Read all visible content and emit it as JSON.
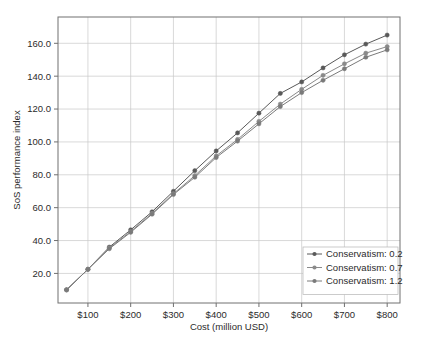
{
  "chart_data": {
    "type": "line",
    "title": "",
    "xlabel": "Cost (million USD)",
    "ylabel": "SoS performance index",
    "xlim": [
      30,
      830
    ],
    "ylim": [
      2,
      176
    ],
    "grid": true,
    "legend_position": "lower right",
    "xtick_labels": [
      "$100",
      "$200",
      "$300",
      "$400",
      "$500",
      "$600",
      "$700",
      "$800"
    ],
    "xtick_values": [
      100,
      200,
      300,
      400,
      500,
      600,
      700,
      800
    ],
    "ytick_labels": [
      "20.0",
      "40.0",
      "60.0",
      "80.0",
      "100.0",
      "120.0",
      "140.0",
      "160.0"
    ],
    "ytick_values": [
      20,
      40,
      60,
      80,
      100,
      120,
      140,
      160
    ],
    "x": [
      50,
      100,
      150,
      200,
      250,
      300,
      350,
      400,
      450,
      500,
      550,
      600,
      650,
      700,
      750,
      800
    ],
    "series": [
      {
        "name": "Conservatism: 0.2",
        "color": "#595959",
        "marker": "circle",
        "values": [
          10.0,
          22.5,
          36.0,
          46.5,
          57.5,
          70.0,
          82.5,
          94.5,
          105.5,
          117.5,
          129.5,
          136.5,
          145.0,
          153.0,
          159.5,
          165.0
        ]
      },
      {
        "name": "Conservatism: 0.7",
        "color": "#8a8a8a",
        "marker": "circle",
        "values": [
          10.0,
          22.5,
          35.5,
          45.5,
          56.5,
          68.5,
          79.5,
          91.5,
          101.5,
          112.5,
          123.0,
          132.0,
          140.5,
          147.5,
          154.0,
          158.0
        ]
      },
      {
        "name": "Conservatism: 1.2",
        "color": "#7a7a7a",
        "marker": "circle",
        "values": [
          10.0,
          22.5,
          35.0,
          45.0,
          56.0,
          68.0,
          78.5,
          90.5,
          100.5,
          111.0,
          121.5,
          130.0,
          137.5,
          144.5,
          151.5,
          156.0
        ]
      }
    ]
  },
  "legend": {
    "items": [
      {
        "label": "Conservatism: 0.2"
      },
      {
        "label": "Conservatism: 0.7"
      },
      {
        "label": "Conservatism: 1.2"
      }
    ]
  }
}
